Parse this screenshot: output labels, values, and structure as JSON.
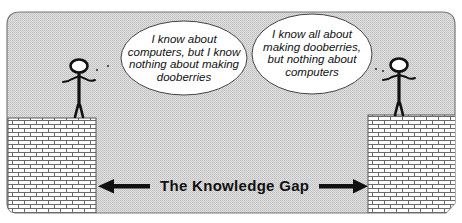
{
  "diagram": {
    "title": "The Knowledge Gap",
    "left_person": {
      "role": "computer-expert",
      "speech": "I know about\ncomputers, but I know\nnothing about making\ndooberries"
    },
    "right_person": {
      "role": "dooberry-expert",
      "speech": "I know all about\nmaking dooberries,\nbut nothing about\ncomputers"
    },
    "colors": {
      "background": "#d9d9d9",
      "frame": "#6e6e6e",
      "brick_mortar": "#555555",
      "brick": "#ffffff",
      "ink": "#111111"
    }
  }
}
